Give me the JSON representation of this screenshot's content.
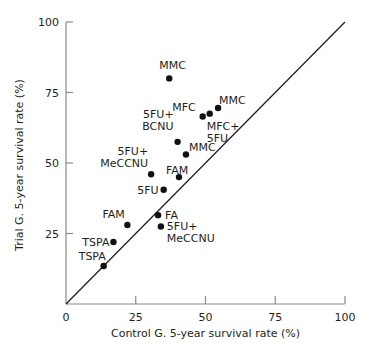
{
  "chart_data": {
    "type": "scatter",
    "title": "",
    "xlabel": "Control G. 5-year survival rate (%)",
    "ylabel": "Trial G. 5-year survival rate (%)",
    "xlim": [
      0,
      100
    ],
    "ylim": [
      0,
      100
    ],
    "xticks": [
      "0",
      "25",
      "50",
      "75",
      "100"
    ],
    "yticks": [
      "25",
      "50",
      "75",
      "100"
    ],
    "grid": false,
    "reference_line": "y = x",
    "points": [
      {
        "label": [
          "MMC"
        ],
        "x": 37,
        "y": 80
      },
      {
        "label": [
          "MMC"
        ],
        "x": 54.5,
        "y": 69.5
      },
      {
        "label": [
          "MFC+",
          "5FU"
        ],
        "x": 51.5,
        "y": 67.5
      },
      {
        "label": [
          "MFC"
        ],
        "x": 49,
        "y": 66.5
      },
      {
        "label": [
          "5FU+",
          "BCNU"
        ],
        "x": 40,
        "y": 57.5
      },
      {
        "label": [
          "MMC"
        ],
        "x": 43,
        "y": 53
      },
      {
        "label": [
          "FAM"
        ],
        "x": 40.5,
        "y": 45
      },
      {
        "label": [
          "5FU+",
          "MeCCNU"
        ],
        "x": 30.5,
        "y": 46
      },
      {
        "label": [
          "5FU"
        ],
        "x": 35,
        "y": 40.5
      },
      {
        "label": [
          "FA"
        ],
        "x": 33,
        "y": 31.5
      },
      {
        "label": [
          "5FU+",
          "MeCCNU"
        ],
        "x": 34,
        "y": 27.5
      },
      {
        "label": [
          "FAM"
        ],
        "x": 22,
        "y": 28
      },
      {
        "label": [
          "TSPA"
        ],
        "x": 17,
        "y": 22
      },
      {
        "label": [
          "TSPA"
        ],
        "x": 13.5,
        "y": 13.5
      }
    ]
  }
}
